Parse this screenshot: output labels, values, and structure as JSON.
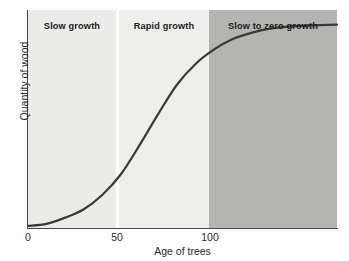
{
  "chart_data": {
    "type": "line",
    "title": "",
    "subtitle": "",
    "xlabel": "Age of trees",
    "ylabel": "Quantity of wood",
    "xlim": [
      0,
      166
    ],
    "ylim": [
      0,
      1.05
    ],
    "grid": false,
    "legend_position": "none",
    "xticks": [
      "0",
      "50",
      "100"
    ],
    "xtick_values": [
      0,
      50,
      100
    ],
    "yticks": [],
    "series": [
      {
        "name": "Quantity of wood",
        "color": "#3a3a3a",
        "linewidth": 2.2,
        "description": "Sigmoid growth curve: slow initial growth, rapid growth between ages 50 and 100, then levelling off to zero growth.",
        "x": [
          0,
          10,
          20,
          30,
          40,
          50,
          60,
          70,
          80,
          90,
          100,
          110,
          120,
          130,
          140,
          150,
          166
        ],
        "y": [
          0.01,
          0.02,
          0.05,
          0.09,
          0.16,
          0.26,
          0.4,
          0.55,
          0.69,
          0.79,
          0.86,
          0.91,
          0.94,
          0.96,
          0.97,
          0.975,
          0.98
        ]
      }
    ],
    "annotations": [
      {
        "name": "slow-growth",
        "label": "Slow growth",
        "x_range": [
          0,
          50
        ],
        "band_color": "#ebebe9"
      },
      {
        "name": "rapid-growth",
        "label": "Rapid growth",
        "x_range": [
          50,
          100
        ],
        "band_color": "#eeeeec"
      },
      {
        "name": "slow-to-zero-growth",
        "label": "Slow to zero growth",
        "x_range": [
          100,
          166
        ],
        "band_color": "#b4b4b2"
      }
    ]
  },
  "axes": {
    "x": {
      "title": "Age of trees",
      "ticks": [
        {
          "label": "0"
        },
        {
          "label": "50"
        },
        {
          "label": "100"
        }
      ]
    },
    "y": {
      "title": "Quantity of wood"
    }
  },
  "bands": [
    {
      "label": "Slow growth"
    },
    {
      "label": "Rapid growth"
    },
    {
      "label": "Slow to zero growth"
    }
  ],
  "colors": {
    "band_slow": "#ebebe9",
    "band_rapid": "#eeeeec",
    "band_zero": "#b4b4b2",
    "curve": "#3a3a3a",
    "axis": "#4a4a4a",
    "text": "#2b2b2b",
    "label_text": "#1d1d1d",
    "background": "#ffffff"
  }
}
